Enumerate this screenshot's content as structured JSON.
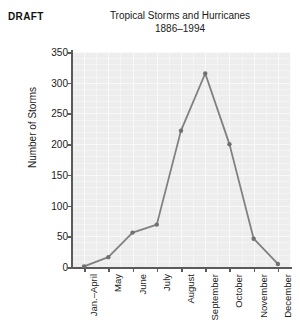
{
  "draft_label": "DRAFT",
  "chart_data": {
    "type": "line",
    "title": "Tropical Storms and Hurricanes",
    "subtitle": "1886–1994",
    "xlabel": "",
    "ylabel": "Number of Storms",
    "categories": [
      "Jan.–April",
      "May",
      "June",
      "July",
      "August",
      "September",
      "October",
      "November",
      "December"
    ],
    "values": [
      1,
      16,
      56,
      69,
      222,
      315,
      200,
      46,
      5
    ],
    "series": [
      {
        "name": "Number of Storms",
        "values": [
          1,
          16,
          56,
          69,
          222,
          315,
          200,
          46,
          5
        ]
      }
    ],
    "ylim": [
      0,
      350
    ],
    "yticks": [
      0,
      50,
      100,
      150,
      200,
      250,
      300,
      350
    ],
    "ytick_labels": [
      "0",
      "50",
      "100",
      "150",
      "200",
      "250",
      "300",
      "350"
    ],
    "grid": true,
    "legend": "none",
    "line_color": "#808080",
    "marker_color": "#707070",
    "plot_background": "#ededed",
    "axis_color": "#5a5a5a"
  }
}
